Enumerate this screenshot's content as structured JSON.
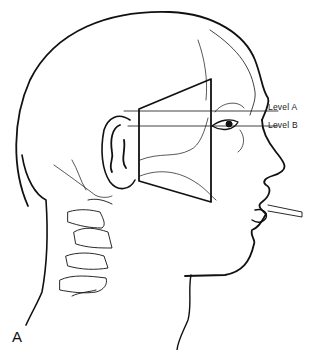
{
  "figure": {
    "panel_label": "A",
    "levels": [
      {
        "label": "Level A",
        "y": 111
      },
      {
        "label": "Level B",
        "y": 126
      }
    ],
    "colors": {
      "line": "#111111",
      "background": "#ffffff"
    }
  }
}
